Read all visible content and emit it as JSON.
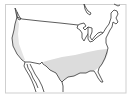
{
  "map": {
    "title": "Range map of the United States",
    "region": "Continental United States",
    "colors": {
      "background": "#ffffff",
      "frame": "#cfcfcf",
      "outline": "#333333",
      "range_fill": "#d9d9d9"
    },
    "legend": [],
    "shaded_regions": [
      {
        "name": "southern-us-band",
        "description": "Shaded band across the southern United States"
      },
      {
        "name": "west-coast-strip",
        "description": "Lightly shaded strip along the Pacific coast"
      }
    ]
  }
}
